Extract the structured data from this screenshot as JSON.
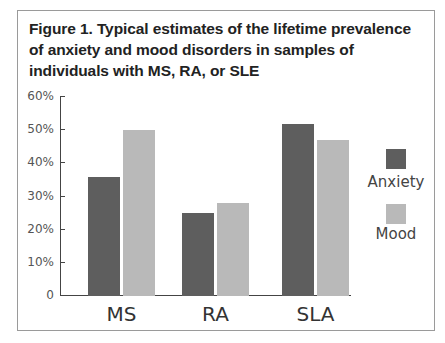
{
  "title": "Figure 1. Typical estimates of the lifetime prevalence of anxiety and mood disorders in samples of individuals with MS, RA, or SLE",
  "colors": {
    "anxiety": "#5e5e5e",
    "mood": "#b9b9b9",
    "axis": "#444444"
  },
  "y_ticks": [
    "0",
    "10%",
    "20%",
    "30%",
    "40%",
    "50%",
    "60%"
  ],
  "legend": [
    {
      "label": "Anxiety",
      "color": "#5e5e5e"
    },
    {
      "label": "Mood",
      "color": "#b9b9b9"
    }
  ],
  "chart_data": {
    "type": "bar",
    "title": "Figure 1. Typical estimates of the lifetime prevalence of anxiety and mood disorders in samples of individuals with MS, RA, or SLE",
    "categories": [
      "MS",
      "RA",
      "SLA"
    ],
    "series": [
      {
        "name": "Anxiety",
        "values": [
          36,
          25,
          52
        ]
      },
      {
        "name": "Mood",
        "values": [
          50,
          28,
          47
        ]
      }
    ],
    "xlabel": "",
    "ylabel": "",
    "ylim": [
      0,
      60
    ],
    "y_tick_labels": [
      "0",
      "10%",
      "20%",
      "30%",
      "40%",
      "50%",
      "60%"
    ],
    "grid": false,
    "legend_position": "right"
  }
}
